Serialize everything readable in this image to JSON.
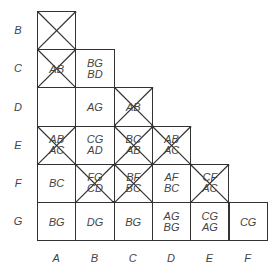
{
  "row_labels": [
    "B",
    "C",
    "D",
    "E",
    "F",
    "G"
  ],
  "col_labels": [
    "A",
    "B",
    "C",
    "D",
    "E",
    "F"
  ],
  "cells": {
    "B_A": {
      "crossed": true,
      "lines": []
    },
    "C_A": {
      "crossed": true,
      "lines": [
        "AB"
      ]
    },
    "C_B": {
      "crossed": false,
      "lines": [
        "BG",
        "BD"
      ]
    },
    "D_A": {
      "crossed": false,
      "lines": []
    },
    "D_B": {
      "crossed": false,
      "lines": [
        "AG"
      ]
    },
    "D_C": {
      "crossed": true,
      "lines": [
        "AB"
      ]
    },
    "E_A": {
      "crossed": true,
      "lines": [
        "AB",
        "AC"
      ]
    },
    "E_B": {
      "crossed": false,
      "lines": [
        "CG",
        "AD"
      ]
    },
    "E_C": {
      "crossed": true,
      "lines": [
        "BC",
        "AB"
      ]
    },
    "E_D": {
      "crossed": true,
      "lines": [
        "AB",
        "AC"
      ]
    },
    "F_A": {
      "crossed": false,
      "lines": [
        "BC"
      ]
    },
    "F_B": {
      "crossed": true,
      "lines": [
        "FG",
        "CD"
      ]
    },
    "F_C": {
      "crossed": true,
      "lines": [
        "BF",
        "BC"
      ]
    },
    "F_D": {
      "crossed": false,
      "lines": [
        "AF",
        "BC"
      ]
    },
    "F_E": {
      "crossed": true,
      "lines": [
        "CF",
        "AC"
      ]
    },
    "G_A": {
      "crossed": false,
      "lines": [
        "BG"
      ]
    },
    "G_B": {
      "crossed": false,
      "lines": [
        "DG"
      ]
    },
    "G_C": {
      "crossed": false,
      "lines": [
        "BG"
      ]
    },
    "G_D": {
      "crossed": false,
      "lines": [
        "AG",
        "BG"
      ]
    },
    "G_E": {
      "crossed": false,
      "lines": [
        "CG",
        "AG"
      ]
    },
    "G_F": {
      "crossed": false,
      "lines": [
        "CG"
      ]
    }
  },
  "colors": {
    "line": "#333333",
    "text": "#444444",
    "background": "#ffffff"
  }
}
